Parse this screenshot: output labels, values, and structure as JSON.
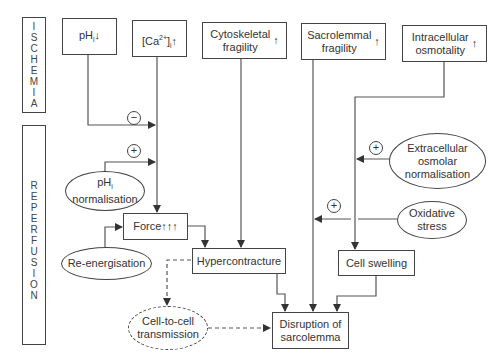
{
  "phases": {
    "ischemia": [
      "I",
      "S",
      "C",
      "H",
      "E",
      "M",
      "I",
      "A"
    ],
    "reperfusion": [
      "R",
      "E",
      "P",
      "E",
      "R",
      "F",
      "U",
      "S",
      "I",
      "O",
      "N"
    ]
  },
  "ischemia_boxes": {
    "ph": {
      "base": "pH",
      "sub": "i",
      "arrow": "↓"
    },
    "ca": {
      "open": "[Ca",
      "sup": "2+",
      "close": "]",
      "sub": "i",
      "arrow": "↑"
    },
    "cytoskeletal": {
      "label": "Cytoskeletal\nfragility",
      "arrow": "↑"
    },
    "sacrolemmal": {
      "label": "Sacrolemmal\nfragility",
      "arrow": "↑"
    },
    "intracellular": {
      "label": "Intracellular\nosmotality",
      "arrow": "↑"
    }
  },
  "reperfusion_nodes": {
    "ph_normalisation": {
      "base": "pH",
      "sub": "i",
      "label": "normalisation"
    },
    "force": "Force↑↑↑",
    "re_energisation": "Re-energisation",
    "hypercontracture": "Hypercontracture",
    "extracellular": "Extracellular\nosmolar\nnormalisation",
    "oxidative": "Oxidative\nstress",
    "cell_swelling": "Cell swelling",
    "cell_to_cell": "Cell-to-cell\ntransmission",
    "disruption": "Disruption of\nsarcolemma"
  },
  "signs": {
    "minus": "−",
    "plus": "+"
  }
}
